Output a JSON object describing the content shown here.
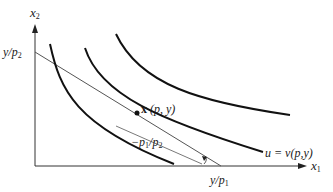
{
  "diagram": {
    "type": "indifference-curves-budget-line",
    "axes": {
      "x_label": {
        "var": "x",
        "sub": "1"
      },
      "y_label": {
        "var": "x",
        "sub": "2"
      }
    },
    "intercepts": {
      "y_intercept": {
        "num": "y/p",
        "sub": "2"
      },
      "x_intercept": {
        "num": "y/p",
        "sub": "1"
      }
    },
    "point_label": {
      "main": "x",
      "args": "(p, y)"
    },
    "slope_label": {
      "prefix": "−p",
      "sub1": "1",
      "mid": "/p",
      "sub2": "2"
    },
    "curve_label": {
      "lhs": "u = v",
      "args": "(p,y)"
    },
    "colors": {
      "curve": "#111111",
      "budget_line": "#555555",
      "axis": "#333333"
    },
    "indifference_curves": 3
  }
}
